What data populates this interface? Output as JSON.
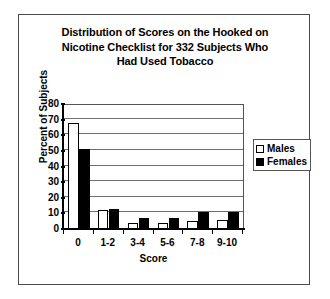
{
  "chart_data": {
    "type": "bar",
    "title": "Distribution of Scores on the Hooked on Nicotine Checklist for 332 Subjects Who Had Used Tobacco",
    "title_lines": [
      "Distribution of Scores on the Hooked on",
      "Nicotine Checklist for 332 Subjects Who",
      "Had Used Tobacco"
    ],
    "xlabel": "Score",
    "ylabel": "Percent of Subjects",
    "categories": [
      "0",
      "1-2",
      "3-4",
      "5-6",
      "7-8",
      "9-10"
    ],
    "series": [
      {
        "name": "Males",
        "color": "#ffffff",
        "values": [
          68,
          12,
          4,
          4,
          5,
          6
        ]
      },
      {
        "name": "Females",
        "color": "#000000",
        "values": [
          51,
          13,
          7,
          7,
          11,
          11
        ]
      }
    ],
    "ylim": [
      0,
      80
    ],
    "yticks": [
      0,
      10,
      20,
      30,
      40,
      50,
      60,
      70,
      80
    ],
    "ytick_labels": [
      "0",
      "10",
      "20",
      "30",
      "40",
      "50",
      "60",
      "70",
      "80"
    ],
    "grid": true,
    "grid_axis": "y",
    "legend_position": "right"
  },
  "legend": {
    "items": [
      {
        "label": "Males",
        "swatch": "open-square-swatch"
      },
      {
        "label": "Females",
        "swatch": "filled-square-swatch"
      }
    ]
  }
}
